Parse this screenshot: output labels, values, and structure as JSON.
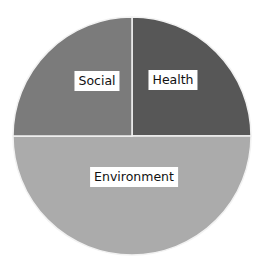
{
  "chart_data": {
    "type": "pie",
    "title": "",
    "categories": [
      "Health",
      "Environment",
      "Social"
    ],
    "values": [
      25,
      50,
      25
    ],
    "colors": [
      "#575757",
      "#ababab",
      "#7b7b7b"
    ],
    "start_angle_deg": 0,
    "direction": "clockwise",
    "legend": "none",
    "labels_on_slices": true
  },
  "labels": {
    "social": "Social",
    "health": "Health",
    "environment": "Environment"
  }
}
